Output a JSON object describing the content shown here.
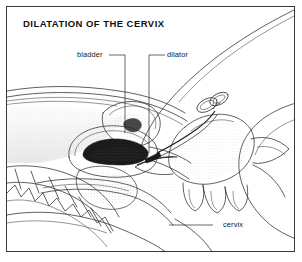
{
  "figure": {
    "title": "DILATATION OF THE CERVIX",
    "kind": "medical-illustration",
    "view": "mid-sagittal section of female pelvis with clinician's hand",
    "border_color": "#3a3a3a",
    "ink_color": "#252525",
    "background_color": "#ffffff"
  },
  "labels": [
    {
      "name": "bladder",
      "text": "bladder",
      "leader": "right-then-down",
      "points_to": "urinary bladder in sagittal section"
    },
    {
      "name": "dilator",
      "text": "dilator",
      "leader": "left-then-down",
      "points_to": "dilator rod entering the cervical canal"
    },
    {
      "name": "cervix",
      "text": "cervix",
      "leader": "horizontal-left",
      "points_to": "cervix at the neck of the uterus"
    }
  ],
  "anatomy": [
    "abdominal wall",
    "urinary bladder",
    "uterus",
    "uterine cavity",
    "cervix",
    "vagina",
    "sacrum",
    "coccyx",
    "thigh",
    "perineum"
  ],
  "instrument": {
    "name": "dilator",
    "features": [
      "ring handles",
      "shaft",
      "tapered tip"
    ]
  }
}
